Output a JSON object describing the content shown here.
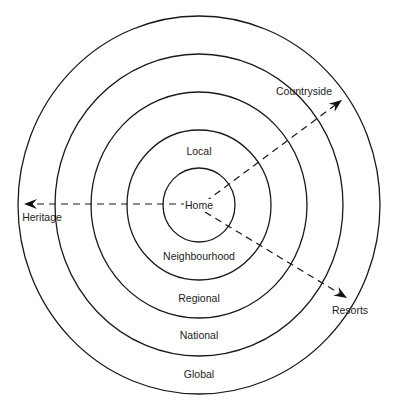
{
  "diagram": {
    "type": "concentric-rings",
    "center": {
      "x": 199,
      "y": 205
    },
    "colors": {
      "stroke": "#1a1a1a",
      "text": "#1c1c1c",
      "background": "#ffffff"
    },
    "rings": [
      {
        "label": "Home",
        "rx": 36,
        "ry": 37,
        "label_x": 199,
        "label_y": 209
      },
      {
        "label": "Local",
        "rx": 72,
        "ry": 75,
        "label_x": 199,
        "label_y": 155
      },
      {
        "label": "Neighbourhood",
        "rx": 108,
        "ry": 113,
        "label_x": 199,
        "label_y": 260
      },
      {
        "label": "Regional",
        "rx": 144,
        "ry": 151,
        "label_x": 199,
        "label_y": 302
      },
      {
        "label": "National",
        "rx": 181,
        "ry": 189,
        "label_x": 199,
        "label_y": 339
      }
    ],
    "outer_label": {
      "label": "Global",
      "x": 199,
      "y": 378
    },
    "arrows": [
      {
        "label": "Countryside",
        "from": [
          205,
          202
        ],
        "to": [
          342,
          100
        ],
        "label_x": 304,
        "label_y": 95
      },
      {
        "label": "Heritage",
        "from": [
          188,
          204
        ],
        "to": [
          24,
          204
        ],
        "label_x": 42,
        "label_y": 221
      },
      {
        "label": "Resorts",
        "from": [
          205,
          212
        ],
        "to": [
          347,
          298
        ],
        "label_x": 350,
        "label_y": 314
      }
    ]
  }
}
